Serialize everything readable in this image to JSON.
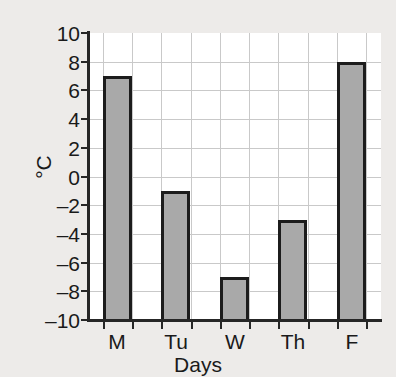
{
  "chart_data": {
    "type": "bar",
    "title": "",
    "subtitle": "",
    "categories": [
      "M",
      "Tu",
      "W",
      "Th",
      "F"
    ],
    "values": [
      7,
      -1,
      -7,
      -3,
      8
    ],
    "xlabel": "Days",
    "ylabel": "°C",
    "ylim": [
      -10,
      10
    ],
    "ytick_values": [
      10,
      8,
      6,
      4,
      2,
      0,
      -2,
      -4,
      -6,
      -8,
      -10
    ],
    "ytick_labels": [
      "10",
      "8",
      "6",
      "4",
      "2",
      "0",
      "–2",
      "–4",
      "–6",
      "–8",
      "–10"
    ],
    "ystep": 2,
    "xtick_labels": [
      "M",
      "Tu",
      "W",
      "Th",
      "F"
    ],
    "grid": true,
    "grid_axis": "both",
    "legend": false,
    "legend_position": "none",
    "bars_drawn_from": -10,
    "annotations": [],
    "series": [
      {
        "name": "Temperature",
        "values": [
          7,
          -1,
          -7,
          -3,
          8
        ]
      }
    ]
  },
  "style": {
    "background_color": "#edebe9",
    "plot_background_color": "#ffffff",
    "bar_fill_color": "#a9a9a9",
    "bar_border_color": "#1c1c1c",
    "gridline_color": "#c9c9c9",
    "axis_color": "#262626",
    "text_color": "#1a1a1a"
  }
}
